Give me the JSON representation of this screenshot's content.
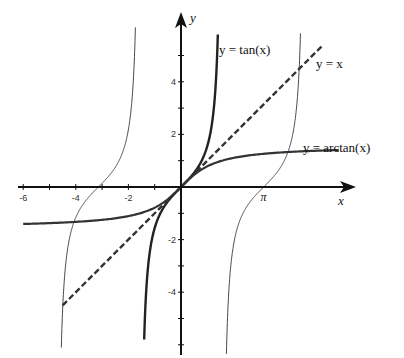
{
  "figure": {
    "width": 404,
    "height": 358,
    "origin_px": [
      181,
      187
    ],
    "px_per_unit": 26.3,
    "background": "#ffffff",
    "axis_color": "#111111"
  },
  "axes": {
    "x_label": "x",
    "y_label": "y",
    "x_ticks": [
      {
        "value": -6,
        "label": "-6"
      },
      {
        "value": -4,
        "label": "-4"
      },
      {
        "value": -2,
        "label": "-2"
      },
      {
        "value": 3.14159,
        "label": "π"
      }
    ],
    "y_ticks": [
      {
        "value": 4,
        "label": "4"
      },
      {
        "value": 2,
        "label": "2"
      },
      {
        "value": -2,
        "label": "-2"
      },
      {
        "value": -4,
        "label": "-4"
      }
    ],
    "x_minor_ticks": [
      -6,
      -5,
      -4,
      -3,
      -2,
      -1
    ],
    "y_minor_ticks": [
      -6,
      -5,
      -4,
      -3,
      -2,
      -1,
      1,
      2,
      3,
      4,
      5
    ]
  },
  "curves": {
    "tan_label": "y = tan(x)",
    "identity_label": "y = x",
    "arctan_label": "y = arctan(x)"
  },
  "chart_data": {
    "type": "line",
    "title": "",
    "xlabel": "x",
    "ylabel": "y",
    "xlim": [
      -6.3,
      6.5
    ],
    "ylim": [
      -6.3,
      6.5
    ],
    "grid": false,
    "series": [
      {
        "name": "y = tan(x)",
        "style": "thick solid",
        "domain": [
          -1.4,
          1.4
        ],
        "function": "tan(x)"
      },
      {
        "name": "tan(x) branch",
        "style": "thin solid",
        "domain": [
          -4.55,
          -1.72
        ],
        "function": "tan(x)"
      },
      {
        "name": "tan(x) branch",
        "style": "thin solid",
        "domain": [
          1.72,
          4.55
        ],
        "function": "tan(x)"
      },
      {
        "name": "y = x",
        "style": "thick dashed",
        "x": [
          -4.5,
          5.4
        ],
        "y": [
          -4.5,
          5.4
        ]
      },
      {
        "name": "y = arctan(x)",
        "style": "thick solid",
        "domain": [
          -6,
          6
        ],
        "function": "arctan(x)"
      }
    ],
    "annotations": [
      {
        "text": "y = tan(x)",
        "x": 1.5,
        "y": 5.0
      },
      {
        "text": "y = x",
        "x": 5.2,
        "y": 4.5
      },
      {
        "text": "y = arctan(x)",
        "x": 4.6,
        "y": 1.45
      },
      {
        "text": "π",
        "x": 3.14159,
        "y": -0.4
      }
    ]
  }
}
